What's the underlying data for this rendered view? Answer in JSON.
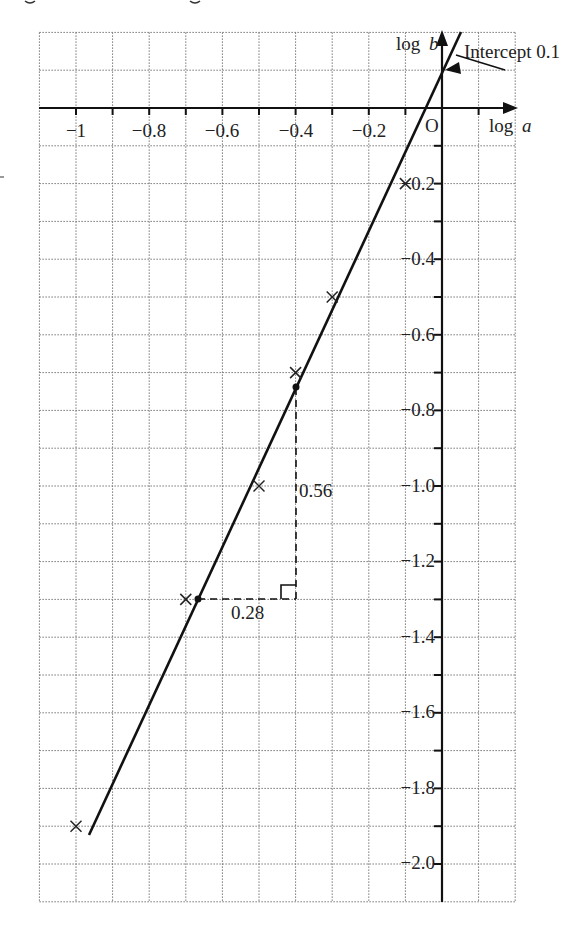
{
  "chart_data": {
    "type": "scatter",
    "title": "",
    "xlabel": "log a",
    "ylabel": "log b",
    "xlim": [
      -1.1,
      0.2
    ],
    "ylim": [
      -2.1,
      0.2
    ],
    "grid": true,
    "grid_step": {
      "x": 0.1,
      "y": 0.1
    },
    "x_ticks": [
      -1,
      -0.8,
      -0.6,
      -0.4,
      -0.2
    ],
    "x_tick_labels": [
      "−1",
      "−0.8",
      "−0.6",
      "−0.4",
      "−0.2"
    ],
    "y_ticks": [
      -0.2,
      -0.4,
      -0.6,
      -0.8,
      -1.0,
      -1.2,
      -1.4,
      -1.6,
      -1.8,
      -2.0
    ],
    "y_tick_labels": [
      "−0.2",
      "−0.4",
      "−0.6",
      "−0.8",
      "−1.0",
      "−1.2",
      "−1.4",
      "−1.6",
      "−1.8",
      "−2.0"
    ],
    "origin_label": "O",
    "series": [
      {
        "name": "data points",
        "marker": "x",
        "points": [
          {
            "x": -1.0,
            "y": -1.9
          },
          {
            "x": -0.7,
            "y": -1.3
          },
          {
            "x": -0.5,
            "y": -1.0
          },
          {
            "x": -0.4,
            "y": -0.7
          },
          {
            "x": -0.3,
            "y": -0.5
          },
          {
            "x": -0.1,
            "y": -0.2
          }
        ]
      },
      {
        "name": "line of best fit",
        "type": "line",
        "gradient": 2,
        "intercept": 0.1,
        "x_range": [
          -1.0,
          0.05
        ]
      },
      {
        "name": "gradient triangle points",
        "marker": "dot",
        "points": [
          {
            "x": -0.67,
            "y": -1.3
          },
          {
            "x": -0.4,
            "y": -0.74
          }
        ]
      }
    ],
    "annotations": [
      {
        "text": "Intercept 0.1",
        "x": 0.0,
        "y": 0.1,
        "arrow": true
      },
      {
        "text": "0.56",
        "label_for": "vertical rise of gradient triangle"
      },
      {
        "text": "0.28",
        "label_for": "horizontal run of gradient triangle"
      }
    ]
  },
  "labels": {
    "x_axis": "log",
    "x_axis_var": "a",
    "y_axis": "log",
    "y_axis_var": "b",
    "origin": "O",
    "intercept": "Intercept 0.1",
    "rise": "0.56",
    "run": "0.28",
    "x_ticks": [
      "−1",
      "−0.8",
      "−0.6",
      "−0.4",
      "−0.2"
    ],
    "y_ticks": [
      "−0.2",
      "−0.4",
      "−0.6",
      "−0.8",
      "−1.0",
      "−1.2",
      "−1.4",
      "−1.6",
      "−1.8",
      "−2.0"
    ]
  }
}
